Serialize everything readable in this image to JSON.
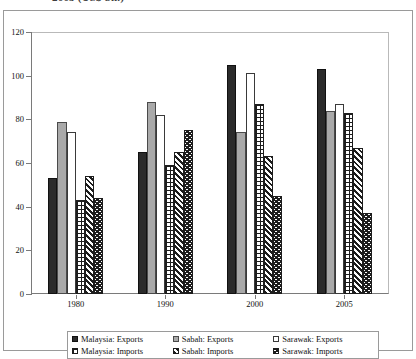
{
  "caption": {
    "text": "2005 (US$ bn.)"
  },
  "chart_data": {
    "type": "bar",
    "title": "",
    "subtitle": "",
    "xlabel": "",
    "ylabel": "",
    "ylim": [
      0,
      120
    ],
    "ytick_step": 20,
    "yticks": [
      "0",
      "20",
      "40",
      "60",
      "80",
      "100",
      "120"
    ],
    "grid": false,
    "legend_position": "bottom",
    "categories": [
      "1980",
      "1990",
      "2000",
      "2005"
    ],
    "series": [
      {
        "name": "Malaysia: Exports",
        "swatch": "solid-black",
        "values": [
          53,
          65,
          105,
          103
        ]
      },
      {
        "name": "Sabah: Exports",
        "swatch": "solid-gray",
        "values": [
          79,
          88,
          74,
          84
        ]
      },
      {
        "name": "Sarawak: Exports",
        "swatch": "open-white",
        "values": [
          74,
          82,
          101,
          87
        ]
      },
      {
        "name": "Malaysia: Imports",
        "swatch": "checkerboard",
        "values": [
          43,
          59,
          87,
          83
        ]
      },
      {
        "name": "Sabah: Imports",
        "swatch": "diagonal-stripes",
        "values": [
          54,
          65,
          63,
          67
        ]
      },
      {
        "name": "Sarawak: Imports",
        "swatch": "chevron-zigzag",
        "values": [
          44,
          75,
          45,
          37
        ]
      }
    ]
  },
  "legend": {
    "items": [
      "Malaysia: Exports",
      "Sabah: Exports",
      "Sarawak: Exports",
      "Malaysia: Imports",
      "Sabah: Imports",
      "Sarawak: Imports"
    ]
  }
}
